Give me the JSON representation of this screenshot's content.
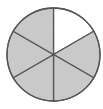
{
  "figure": {
    "type": "fraction-circle",
    "total_parts": 6,
    "shaded_parts": 5,
    "unshaded_parts": 1,
    "fraction_shaded": "5/6",
    "colors": {
      "shaded": "#c9c9c9",
      "unshaded": "#ffffff",
      "stroke": "#555555"
    },
    "slices": [
      {
        "index": 0,
        "start_deg": -90,
        "end_deg": -30,
        "shaded": false
      },
      {
        "index": 1,
        "start_deg": -30,
        "end_deg": 30,
        "shaded": true
      },
      {
        "index": 2,
        "start_deg": 30,
        "end_deg": 90,
        "shaded": true
      },
      {
        "index": 3,
        "start_deg": 90,
        "end_deg": 150,
        "shaded": true
      },
      {
        "index": 4,
        "start_deg": 150,
        "end_deg": 210,
        "shaded": true
      },
      {
        "index": 5,
        "start_deg": 210,
        "end_deg": 270,
        "shaded": true
      }
    ]
  }
}
